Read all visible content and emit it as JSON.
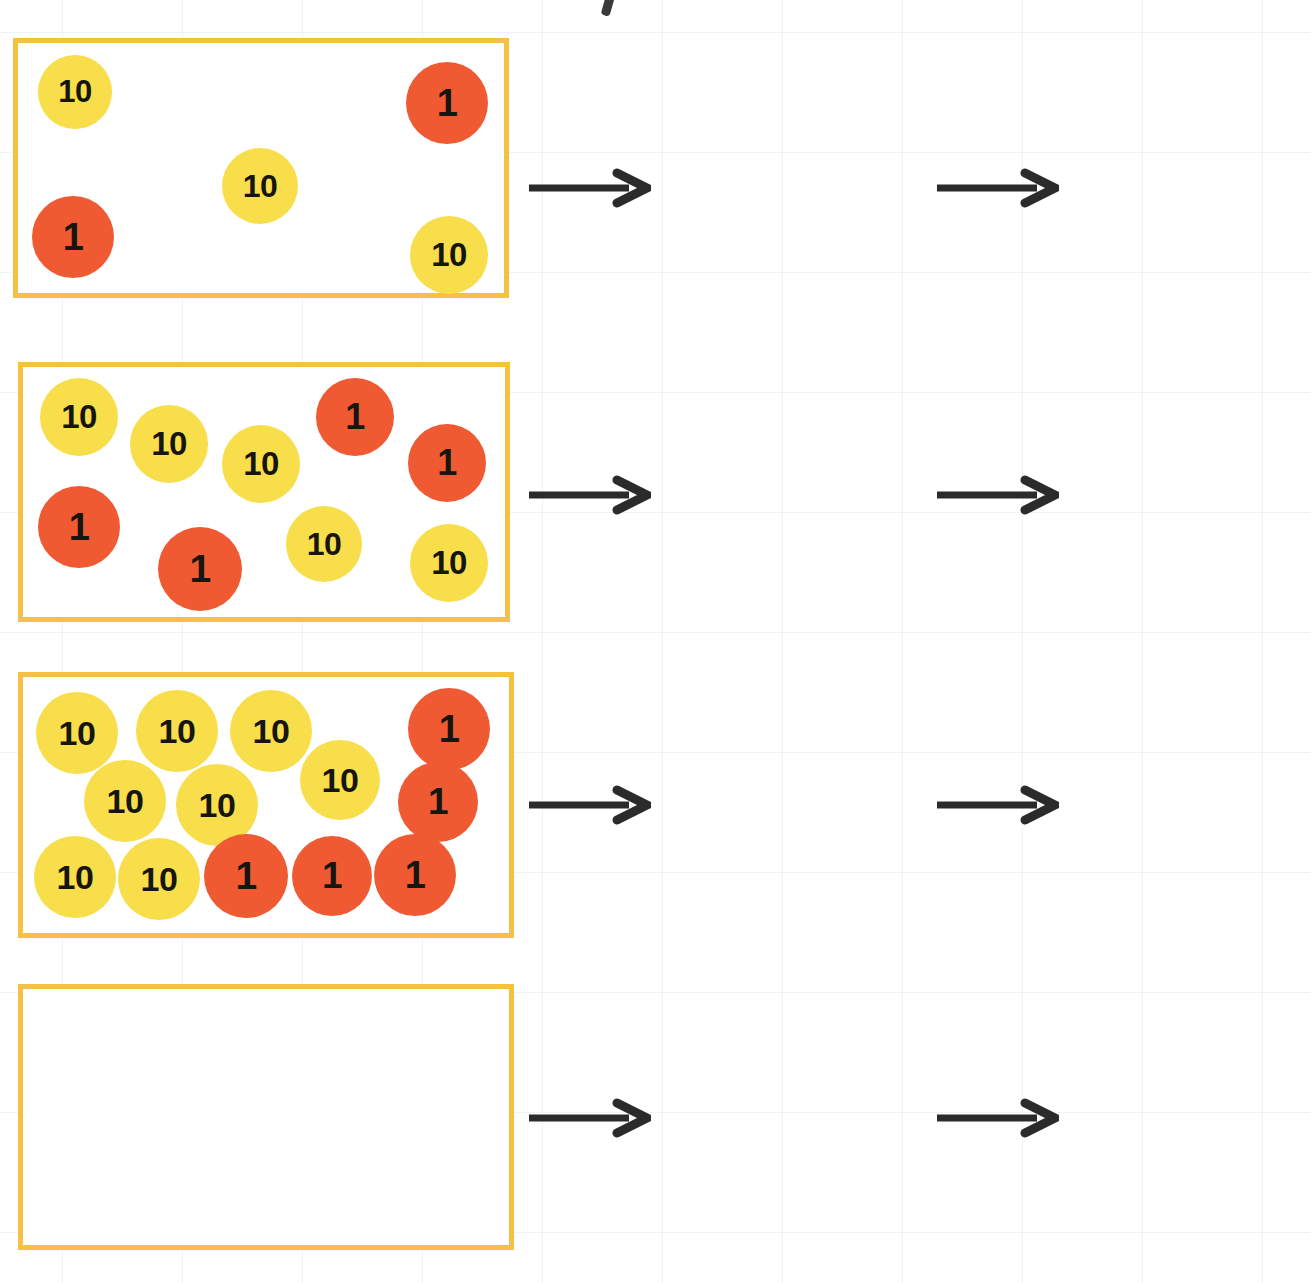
{
  "worksheet": {
    "title": "Place value discs to arrow cards",
    "stray_mark": "'",
    "colors": {
      "ten_disc": "#F7DE4A",
      "one_disc": "#F05A32",
      "card_outline": "#F5C144",
      "box_border": "#F5C144",
      "arrow": "#2b2b2b",
      "digit_text": "#1a1a1a"
    },
    "labels": {
      "ten": "10",
      "one": "1"
    }
  },
  "rows": [
    {
      "id": "row-1",
      "discs": {
        "tens_count": 3,
        "ones_count": 2,
        "items": [
          {
            "type": "ten",
            "label": "10",
            "x": 38,
            "y": 55,
            "size": 74
          },
          {
            "type": "one",
            "label": "1",
            "x": 406,
            "y": 62,
            "size": 82
          },
          {
            "type": "ten",
            "label": "10",
            "x": 222,
            "y": 148,
            "size": 76
          },
          {
            "type": "one",
            "label": "1",
            "x": 32,
            "y": 196,
            "size": 82
          },
          {
            "type": "ten",
            "label": "10",
            "x": 410,
            "y": 216,
            "size": 78
          }
        ]
      },
      "tens_card": {
        "cells": [
          "3",
          "0"
        ],
        "filled": true
      },
      "ones_card": {
        "cells": [
          "2"
        ],
        "filled": true
      },
      "result_card": {
        "cells": [
          "3",
          "2"
        ],
        "filled": true
      }
    },
    {
      "id": "row-2",
      "discs": {
        "tens_count": 5,
        "ones_count": 4,
        "items": [
          {
            "type": "ten",
            "label": "10",
            "x": 40,
            "y": 378,
            "size": 78
          },
          {
            "type": "ten",
            "label": "10",
            "x": 130,
            "y": 405,
            "size": 78
          },
          {
            "type": "one",
            "label": "1",
            "x": 316,
            "y": 378,
            "size": 78
          },
          {
            "type": "ten",
            "label": "10",
            "x": 222,
            "y": 425,
            "size": 78
          },
          {
            "type": "one",
            "label": "1",
            "x": 408,
            "y": 424,
            "size": 78
          },
          {
            "type": "one",
            "label": "1",
            "x": 38,
            "y": 486,
            "size": 82
          },
          {
            "type": "one",
            "label": "1",
            "x": 158,
            "y": 527,
            "size": 84
          },
          {
            "type": "ten",
            "label": "10",
            "x": 286,
            "y": 506,
            "size": 76
          },
          {
            "type": "ten",
            "label": "10",
            "x": 410,
            "y": 524,
            "size": 78
          }
        ]
      },
      "tens_card": {
        "cells": [
          "",
          "0"
        ],
        "filled": false
      },
      "ones_card": {
        "cells": [
          ""
        ],
        "filled": false
      },
      "result_card": {
        "cells": [
          "",
          ""
        ],
        "filled": false
      }
    },
    {
      "id": "row-3",
      "discs": {
        "tens_count": 8,
        "ones_count": 5,
        "items": [
          {
            "type": "ten",
            "label": "10",
            "x": 36,
            "y": 692,
            "size": 82
          },
          {
            "type": "ten",
            "label": "10",
            "x": 136,
            "y": 690,
            "size": 82
          },
          {
            "type": "ten",
            "label": "10",
            "x": 230,
            "y": 690,
            "size": 82
          },
          {
            "type": "one",
            "label": "1",
            "x": 408,
            "y": 688,
            "size": 82
          },
          {
            "type": "ten",
            "label": "10",
            "x": 84,
            "y": 760,
            "size": 82
          },
          {
            "type": "ten",
            "label": "10",
            "x": 176,
            "y": 764,
            "size": 82
          },
          {
            "type": "ten",
            "label": "10",
            "x": 300,
            "y": 740,
            "size": 80
          },
          {
            "type": "one",
            "label": "1",
            "x": 398,
            "y": 762,
            "size": 80
          },
          {
            "type": "ten",
            "label": "10",
            "x": 34,
            "y": 836,
            "size": 82
          },
          {
            "type": "ten",
            "label": "10",
            "x": 118,
            "y": 838,
            "size": 82
          },
          {
            "type": "one",
            "label": "1",
            "x": 204,
            "y": 834,
            "size": 84
          },
          {
            "type": "one",
            "label": "1",
            "x": 292,
            "y": 836,
            "size": 80
          },
          {
            "type": "one",
            "label": "1",
            "x": 374,
            "y": 834,
            "size": 82
          }
        ]
      },
      "tens_card": {
        "cells": [
          "",
          "0"
        ],
        "filled": false
      },
      "ones_card": {
        "cells": [
          ""
        ],
        "filled": false
      },
      "result_card": {
        "cells": [
          "",
          ""
        ],
        "filled": false
      }
    },
    {
      "id": "row-4",
      "discs": {
        "tens_count": 0,
        "ones_count": 0,
        "items": []
      },
      "tens_card": {
        "cells": [
          "",
          "0"
        ],
        "filled": false
      },
      "ones_card": {
        "cells": [
          ""
        ],
        "filled": false
      },
      "result_card": {
        "cells": [
          "4",
          "3"
        ],
        "filled": true
      }
    }
  ],
  "geometry": {
    "boxes": [
      {
        "row": "row-1",
        "x": 13,
        "y": 38,
        "w": 496,
        "h": 260
      },
      {
        "row": "row-2",
        "x": 18,
        "y": 362,
        "w": 492,
        "h": 260
      },
      {
        "row": "row-3",
        "x": 18,
        "y": 672,
        "w": 496,
        "h": 266
      },
      {
        "row": "row-4",
        "x": 18,
        "y": 984,
        "w": 496,
        "h": 266
      }
    ],
    "arrows_left": [
      {
        "row": "row-1",
        "x": 527,
        "y": 168
      },
      {
        "row": "row-2",
        "x": 527,
        "y": 475
      },
      {
        "row": "row-3",
        "x": 527,
        "y": 785
      },
      {
        "row": "row-4",
        "x": 527,
        "y": 1098
      }
    ],
    "arrows_right": [
      {
        "row": "row-1",
        "x": 935,
        "y": 168
      },
      {
        "row": "row-2",
        "x": 935,
        "y": 475
      },
      {
        "row": "row-3",
        "x": 935,
        "y": 785
      },
      {
        "row": "row-4",
        "x": 935,
        "y": 1098
      }
    ],
    "tens_cards": [
      {
        "row": "row-1",
        "x": 676,
        "y": 85
      },
      {
        "row": "row-2",
        "x": 676,
        "y": 392
      },
      {
        "row": "row-3",
        "x": 676,
        "y": 702
      },
      {
        "row": "row-4",
        "x": 676,
        "y": 1015
      }
    ],
    "ones_cards": [
      {
        "row": "row-1",
        "x": 676,
        "y": 198
      },
      {
        "row": "row-2",
        "x": 676,
        "y": 505
      },
      {
        "row": "row-3",
        "x": 676,
        "y": 815
      },
      {
        "row": "row-4",
        "x": 676,
        "y": 1128
      }
    ],
    "result_cards": [
      {
        "row": "row-1",
        "x": 1077,
        "y": 141
      },
      {
        "row": "row-2",
        "x": 1077,
        "y": 448
      },
      {
        "row": "row-3",
        "x": 1077,
        "y": 758
      },
      {
        "row": "row-4",
        "x": 1077,
        "y": 1071
      }
    ]
  }
}
